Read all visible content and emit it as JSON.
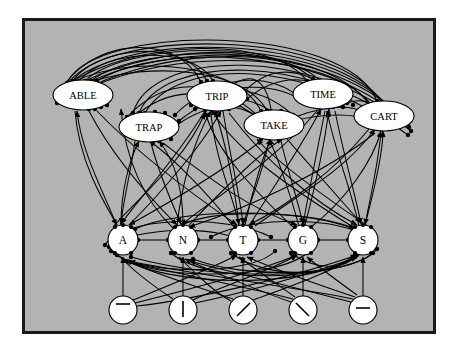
{
  "figure": {
    "panel": {
      "background_color": "#b3b3b3",
      "border_color": "#1a1a1a",
      "outside_color": "#ffffff"
    }
  },
  "levels": {
    "word_level": {
      "name": "word-level",
      "node_shape": "ellipse",
      "nodes": [
        {
          "label": "ABLE",
          "cx": 58,
          "cy": 74,
          "rx": 30,
          "ry": 15
        },
        {
          "label": "TRAP",
          "cx": 124,
          "cy": 106,
          "rx": 30,
          "ry": 15
        },
        {
          "label": "TRIP",
          "cx": 192,
          "cy": 75,
          "rx": 30,
          "ry": 15
        },
        {
          "label": "TAKE",
          "cx": 249,
          "cy": 104,
          "rx": 30,
          "ry": 15
        },
        {
          "label": "TIME",
          "cx": 298,
          "cy": 73,
          "rx": 30,
          "ry": 15
        },
        {
          "label": "CART",
          "cx": 359,
          "cy": 95,
          "rx": 30,
          "ry": 15
        }
      ]
    },
    "letter_level": {
      "name": "letter-level",
      "node_shape": "circle",
      "nodes": [
        {
          "label": "A",
          "cx": 98,
          "cy": 219,
          "r": 15
        },
        {
          "label": "N",
          "cx": 158,
          "cy": 219,
          "r": 15
        },
        {
          "label": "T",
          "cx": 218,
          "cy": 219,
          "r": 15
        },
        {
          "label": "G",
          "cx": 278,
          "cy": 219,
          "r": 15
        },
        {
          "label": "S",
          "cx": 338,
          "cy": 219,
          "r": 15
        }
      ]
    },
    "feature_level": {
      "name": "feature-level",
      "node_shape": "circle",
      "nodes": [
        {
          "glyph": "horizontal-bar-upper",
          "cx": 98,
          "cy": 289,
          "r": 14
        },
        {
          "glyph": "vertical-bar",
          "cx": 158,
          "cy": 289,
          "r": 14
        },
        {
          "glyph": "forward-slash",
          "cx": 218,
          "cy": 289,
          "r": 14
        },
        {
          "glyph": "back-slash",
          "cx": 278,
          "cy": 289,
          "r": 14
        },
        {
          "glyph": "horizontal-bar-mid",
          "cx": 338,
          "cy": 289,
          "r": 14
        }
      ]
    }
  },
  "connection_legend": {
    "excitatory": "arrowhead",
    "inhibitory": "filled-dot"
  }
}
